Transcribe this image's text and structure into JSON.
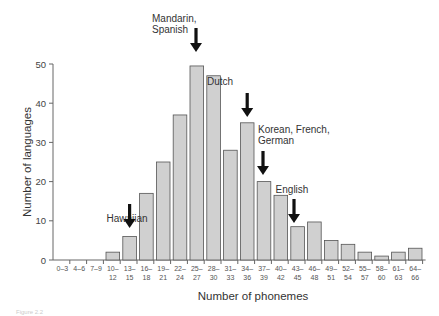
{
  "chart_data": {
    "type": "bar",
    "title": "",
    "xlabel": "Number of phonemes",
    "ylabel": "Number of languages",
    "ylim": [
      0,
      50
    ],
    "yticks": [
      0,
      10,
      20,
      30,
      40,
      50
    ],
    "grid": false,
    "legend": null,
    "categories": [
      [
        "0–3"
      ],
      [
        "4–6"
      ],
      [
        "7–9"
      ],
      [
        "10–",
        "12"
      ],
      [
        "13–",
        "15"
      ],
      [
        "16–",
        "18"
      ],
      [
        "19–",
        "21"
      ],
      [
        "22–",
        "24"
      ],
      [
        "25–",
        "27"
      ],
      [
        "28–",
        "30"
      ],
      [
        "31–",
        "33"
      ],
      [
        "34–",
        "36"
      ],
      [
        "37–",
        "39"
      ],
      [
        "40–",
        "42"
      ],
      [
        "43–",
        "45"
      ],
      [
        "46–",
        "48"
      ],
      [
        "49–",
        "51"
      ],
      [
        "52–",
        "54"
      ],
      [
        "55–",
        "57"
      ],
      [
        "58–",
        "60"
      ],
      [
        "61–",
        "63"
      ],
      [
        "64–",
        "66"
      ]
    ],
    "values": [
      0,
      0,
      0,
      2,
      6,
      17,
      25,
      37,
      49.5,
      47,
      28,
      35,
      20,
      16.5,
      8.5,
      9.7,
      5,
      4,
      2,
      1,
      2,
      3
    ],
    "annotations": [
      {
        "lines": [
          "Hawaiian"
        ],
        "category_index": 4
      },
      {
        "lines": [
          "Mandarin,",
          "Spanish"
        ],
        "category_index": 8
      },
      {
        "lines": [
          "Dutch"
        ],
        "category_index": 11
      },
      {
        "lines": [
          "Korean, French,",
          "German"
        ],
        "category_index": 12
      },
      {
        "lines": [
          "English"
        ],
        "category_index": 14
      }
    ],
    "colors": {
      "bar_fill": "#d0d0d0",
      "bar_stroke": "#555555",
      "arrow": "#111111"
    }
  },
  "caption": "Figure 2.2"
}
